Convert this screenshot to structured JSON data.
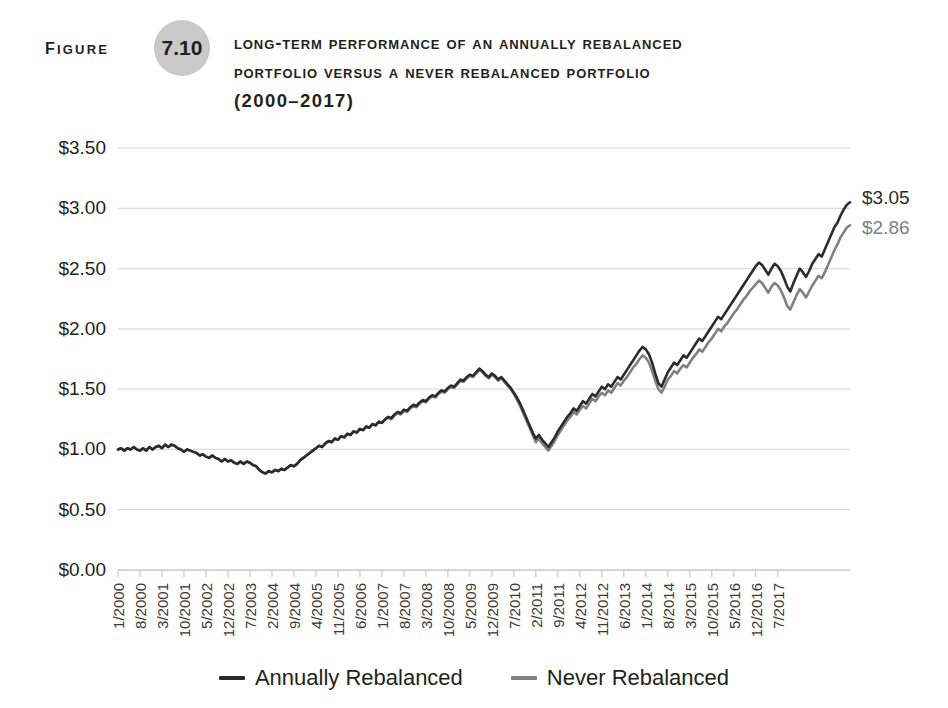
{
  "figure": {
    "label": "Figure",
    "number": "7.10",
    "title_lines": [
      "Long-Term Performance of an Annually Rebalanced",
      "Portfolio versus a Never Rebalanced Portfolio",
      "(2000–2017)"
    ]
  },
  "colors": {
    "series_annually_rebalanced": "#2b2b2b",
    "series_never_rebalanced": "#808080",
    "gridline": "#dcdcdc",
    "axis": "#c8c8c8",
    "badge": "#c9c9c9",
    "text": "#231f20"
  },
  "legend": {
    "position": "bottom-center",
    "items": [
      {
        "label": "Annually Rebalanced",
        "color": "#2b2b2b"
      },
      {
        "label": "Never Rebalanced",
        "color": "#808080"
      }
    ]
  },
  "endpoint_labels": [
    {
      "text": "$3.05",
      "color": "#2b2b2b",
      "series": "Annually Rebalanced"
    },
    {
      "text": "$2.86",
      "color": "#808080",
      "series": "Never Rebalanced"
    }
  ],
  "chart_data": {
    "type": "line",
    "title": "Long-Term Performance of an Annually Rebalanced Portfolio versus a Never Rebalanced Portfolio (2000–2017)",
    "xlabel": "",
    "ylabel": "",
    "grid": true,
    "ylim": [
      0.0,
      3.5
    ],
    "ytick_labels": [
      "$0.00",
      "$0.50",
      "$1.00",
      "$1.50",
      "$2.00",
      "$2.50",
      "$3.00",
      "$3.50"
    ],
    "ytick_values": [
      0.0,
      0.5,
      1.0,
      1.5,
      2.0,
      2.5,
      3.0,
      3.5
    ],
    "xtick_labels": [
      "1/2000",
      "8/2000",
      "3/2001",
      "10/2001",
      "5/2002",
      "12/2002",
      "7/2003",
      "2/2004",
      "9/2004",
      "4/2005",
      "11/2005",
      "6/2006",
      "1/2007",
      "8/2007",
      "3/2008",
      "10/2008",
      "5/2009",
      "12/2009",
      "7/2010",
      "2/2011",
      "9/2011",
      "4/2012",
      "11/2012",
      "6/2013",
      "1/2014",
      "8/2014",
      "3/2015",
      "10/2015",
      "5/2016",
      "12/2016",
      "7/2017"
    ],
    "xtick_index_step": 7,
    "x_start": "1/2000",
    "x_end": "12/2017",
    "n_points": 216,
    "series": [
      {
        "name": "Annually Rebalanced",
        "color": "#2b2b2b",
        "final_value": 3.05,
        "values": [
          1.0,
          1.01,
          0.99,
          1.01,
          1.0,
          1.02,
          1.0,
          0.99,
          1.01,
          0.99,
          1.02,
          1.0,
          1.02,
          1.03,
          1.01,
          1.04,
          1.02,
          1.04,
          1.03,
          1.01,
          1.0,
          0.98,
          1.0,
          0.99,
          0.98,
          0.97,
          0.95,
          0.96,
          0.94,
          0.93,
          0.95,
          0.93,
          0.92,
          0.9,
          0.92,
          0.9,
          0.91,
          0.89,
          0.88,
          0.9,
          0.88,
          0.9,
          0.89,
          0.87,
          0.86,
          0.83,
          0.81,
          0.8,
          0.82,
          0.81,
          0.83,
          0.82,
          0.84,
          0.83,
          0.85,
          0.87,
          0.86,
          0.88,
          0.91,
          0.93,
          0.95,
          0.97,
          0.99,
          1.01,
          1.03,
          1.02,
          1.05,
          1.07,
          1.06,
          1.09,
          1.08,
          1.11,
          1.1,
          1.13,
          1.12,
          1.15,
          1.14,
          1.17,
          1.16,
          1.19,
          1.18,
          1.21,
          1.2,
          1.23,
          1.22,
          1.25,
          1.27,
          1.26,
          1.29,
          1.31,
          1.3,
          1.33,
          1.32,
          1.35,
          1.37,
          1.36,
          1.39,
          1.41,
          1.4,
          1.43,
          1.45,
          1.44,
          1.47,
          1.49,
          1.48,
          1.51,
          1.53,
          1.52,
          1.55,
          1.58,
          1.57,
          1.6,
          1.62,
          1.61,
          1.64,
          1.67,
          1.65,
          1.62,
          1.6,
          1.63,
          1.61,
          1.58,
          1.6,
          1.57,
          1.54,
          1.51,
          1.47,
          1.43,
          1.38,
          1.32,
          1.26,
          1.2,
          1.14,
          1.09,
          1.12,
          1.08,
          1.05,
          1.02,
          1.06,
          1.1,
          1.15,
          1.19,
          1.23,
          1.27,
          1.3,
          1.34,
          1.32,
          1.36,
          1.4,
          1.38,
          1.42,
          1.46,
          1.44,
          1.48,
          1.52,
          1.5,
          1.54,
          1.52,
          1.56,
          1.6,
          1.58,
          1.62,
          1.66,
          1.7,
          1.74,
          1.78,
          1.82,
          1.85,
          1.83,
          1.79,
          1.72,
          1.63,
          1.55,
          1.52,
          1.58,
          1.64,
          1.68,
          1.72,
          1.7,
          1.74,
          1.78,
          1.76,
          1.8,
          1.84,
          1.88,
          1.92,
          1.9,
          1.94,
          1.98,
          2.02,
          2.06,
          2.1,
          2.08,
          2.12,
          2.16,
          2.2,
          2.24,
          2.28,
          2.32,
          2.36,
          2.4,
          2.44,
          2.48,
          2.52,
          2.55,
          2.53,
          2.49,
          2.45,
          2.5,
          2.54,
          2.52,
          2.48,
          2.42,
          2.35,
          2.31,
          2.38,
          2.44,
          2.5,
          2.47,
          2.43,
          2.48,
          2.54,
          2.58,
          2.62,
          2.6,
          2.66,
          2.72,
          2.78,
          2.84,
          2.88,
          2.94,
          2.99,
          3.03,
          3.05
        ]
      },
      {
        "name": "Never Rebalanced",
        "color": "#808080",
        "final_value": 2.86,
        "values": [
          1.0,
          1.01,
          0.99,
          1.01,
          1.0,
          1.02,
          1.0,
          0.99,
          1.01,
          0.99,
          1.02,
          1.0,
          1.02,
          1.03,
          1.01,
          1.04,
          1.02,
          1.04,
          1.03,
          1.01,
          1.0,
          0.98,
          1.0,
          0.99,
          0.98,
          0.97,
          0.95,
          0.96,
          0.94,
          0.93,
          0.95,
          0.93,
          0.92,
          0.9,
          0.92,
          0.9,
          0.91,
          0.89,
          0.88,
          0.9,
          0.88,
          0.9,
          0.89,
          0.87,
          0.86,
          0.83,
          0.81,
          0.8,
          0.82,
          0.81,
          0.83,
          0.82,
          0.84,
          0.83,
          0.85,
          0.87,
          0.86,
          0.88,
          0.91,
          0.93,
          0.95,
          0.97,
          0.99,
          1.01,
          1.03,
          1.02,
          1.05,
          1.07,
          1.06,
          1.09,
          1.08,
          1.11,
          1.1,
          1.13,
          1.12,
          1.15,
          1.14,
          1.17,
          1.16,
          1.19,
          1.18,
          1.21,
          1.2,
          1.23,
          1.22,
          1.25,
          1.26,
          1.25,
          1.28,
          1.3,
          1.29,
          1.32,
          1.31,
          1.34,
          1.36,
          1.35,
          1.38,
          1.4,
          1.39,
          1.42,
          1.44,
          1.43,
          1.46,
          1.48,
          1.47,
          1.5,
          1.52,
          1.51,
          1.54,
          1.57,
          1.56,
          1.59,
          1.61,
          1.6,
          1.63,
          1.66,
          1.64,
          1.61,
          1.59,
          1.62,
          1.6,
          1.57,
          1.59,
          1.56,
          1.53,
          1.5,
          1.46,
          1.41,
          1.36,
          1.3,
          1.24,
          1.18,
          1.12,
          1.06,
          1.09,
          1.05,
          1.02,
          0.99,
          1.03,
          1.07,
          1.12,
          1.16,
          1.2,
          1.24,
          1.27,
          1.31,
          1.29,
          1.33,
          1.36,
          1.34,
          1.38,
          1.42,
          1.4,
          1.44,
          1.47,
          1.45,
          1.49,
          1.47,
          1.51,
          1.55,
          1.53,
          1.57,
          1.6,
          1.64,
          1.68,
          1.71,
          1.75,
          1.78,
          1.76,
          1.72,
          1.65,
          1.57,
          1.5,
          1.47,
          1.52,
          1.58,
          1.61,
          1.65,
          1.63,
          1.67,
          1.7,
          1.68,
          1.72,
          1.76,
          1.79,
          1.83,
          1.81,
          1.85,
          1.89,
          1.92,
          1.96,
          2.0,
          1.98,
          2.02,
          2.05,
          2.09,
          2.13,
          2.16,
          2.2,
          2.24,
          2.27,
          2.31,
          2.34,
          2.37,
          2.4,
          2.38,
          2.34,
          2.3,
          2.35,
          2.38,
          2.36,
          2.32,
          2.26,
          2.19,
          2.16,
          2.22,
          2.28,
          2.33,
          2.3,
          2.26,
          2.31,
          2.36,
          2.4,
          2.44,
          2.42,
          2.47,
          2.53,
          2.59,
          2.65,
          2.7,
          2.76,
          2.8,
          2.84,
          2.86
        ]
      }
    ]
  }
}
